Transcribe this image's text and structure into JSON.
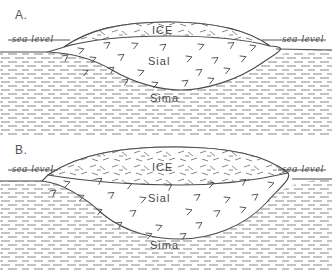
{
  "figure": {
    "background_color": "#ffffff",
    "ink_color": "#4d4d4d"
  },
  "panels": [
    {
      "id": "A",
      "letter": "A.",
      "ice_thickness_note": "thin ice sheet, shallow crustal root",
      "labels": {
        "sea_level_left": "sea  level",
        "sea_level_right": "sea  level",
        "ice": "ICE",
        "sial": "Sial",
        "sima": "Sima"
      }
    },
    {
      "id": "B",
      "letter": "B.",
      "ice_thickness_note": "thick ice sheet, deep crustal root, depressed surface",
      "labels": {
        "sea_level_left": "sea  level",
        "sea_level_right": "sea  level",
        "ice": "ICE",
        "sial": "Sial",
        "sima": "Sima"
      }
    }
  ],
  "legend_units": {
    "ice": "ICE",
    "crust": "Sial",
    "mantle": "Sima"
  }
}
